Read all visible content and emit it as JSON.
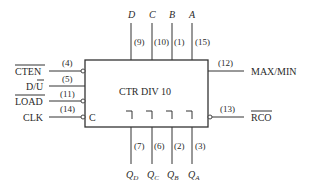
{
  "diagram": {
    "title": "CTR DIV 10",
    "clock_label": "C",
    "colors": {
      "line": "#333333",
      "text": "#2a2a2a",
      "background": "#ffffff"
    },
    "left_inputs": [
      {
        "name": "CTEN",
        "overbar": true,
        "pin": "(4)",
        "inverted": true
      },
      {
        "name": "D/U",
        "overbar_part": "U",
        "prefix": "D/",
        "pin": "(5)",
        "inverted": false
      },
      {
        "name": "LOAD",
        "overbar": true,
        "pin": "(11)",
        "inverted": true
      },
      {
        "name": "CLK",
        "overbar": false,
        "pin": "(14)",
        "inverted": true
      }
    ],
    "right_outputs": [
      {
        "name": "MAX/MIN",
        "overbar": false,
        "pin": "(12)",
        "inverted": false
      },
      {
        "name": "RCO",
        "overbar": true,
        "pin": "(13)",
        "inverted": true
      }
    ],
    "top_inputs": [
      {
        "name": "D",
        "pin": "(9)"
      },
      {
        "name": "C",
        "pin": "(10)"
      },
      {
        "name": "B",
        "pin": "(1)"
      },
      {
        "name": "A",
        "pin": "(15)"
      }
    ],
    "bottom_outputs": [
      {
        "name": "Q",
        "sub": "D",
        "pin": "(7)"
      },
      {
        "name": "Q",
        "sub": "C",
        "pin": "(6)"
      },
      {
        "name": "Q",
        "sub": "B",
        "pin": "(2)"
      },
      {
        "name": "Q",
        "sub": "A",
        "pin": "(3)"
      }
    ]
  }
}
